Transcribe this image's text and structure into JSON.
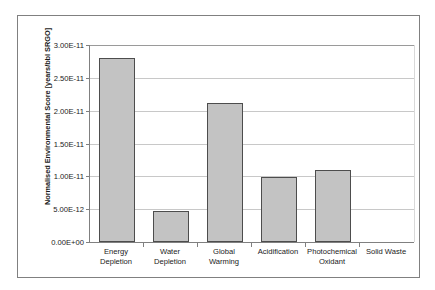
{
  "chart_data": {
    "type": "bar",
    "title": "",
    "xlabel": "",
    "ylabel": "Normalised Environmental Score [years/bbl SRGO]",
    "categories": [
      "Energy Depletion",
      "Water Depletion",
      "Global Warming",
      "Acidification",
      "Photochemical Oxidant",
      "Solid Waste"
    ],
    "category_lines": [
      [
        "Energy",
        "Depletion"
      ],
      [
        "Water",
        "Depletion"
      ],
      [
        "Global",
        "Warming"
      ],
      [
        "Acidification"
      ],
      [
        "Photochemical",
        "Oxidant"
      ],
      [
        "Solid Waste"
      ]
    ],
    "values": [
      2.8e-11,
      4.7e-12,
      2.11e-11,
      9.9e-12,
      1.09e-11,
      0
    ],
    "ylim": [
      0,
      3e-11
    ],
    "ytick_values": [
      0,
      5e-12,
      1e-11,
      1.5e-11,
      2e-11,
      2.5e-11,
      3e-11
    ],
    "ytick_labels": [
      "0.00E+00",
      "5.00E-12",
      "1.00E-11",
      "1.50E-11",
      "2.00E-11",
      "2.50E-11",
      "3.00E-11"
    ],
    "grid": true,
    "legend": false,
    "bar_fill_color": "#c3c3c3",
    "bar_border_color": "#4d4d4d",
    "gridline_color": "#c8c8c8",
    "axis_color": "#808080",
    "plot_background": "#ffffff"
  }
}
